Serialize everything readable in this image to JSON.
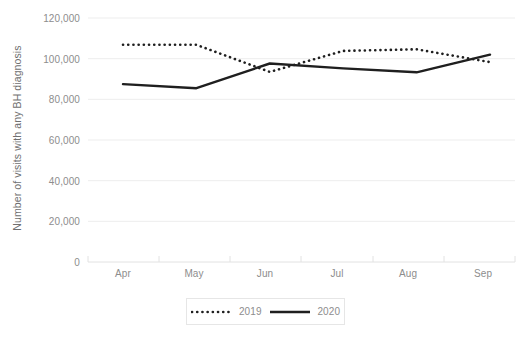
{
  "chart_data": {
    "type": "line",
    "title": "",
    "xlabel": "",
    "ylabel": "Number of visits with any BH diagnosis",
    "categories": [
      "Apr",
      "May",
      "Jun",
      "Jul",
      "Aug",
      "Sep"
    ],
    "ylim": [
      0,
      120000
    ],
    "y_ticks": [
      0,
      20000,
      40000,
      60000,
      80000,
      100000,
      120000
    ],
    "y_tick_labels": [
      "0",
      "20,000",
      "40,000",
      "60,000",
      "80,000",
      "100,000",
      "120,000"
    ],
    "grid": true,
    "legend_position": "bottom-center",
    "series": [
      {
        "name": "2019",
        "style": "dotted",
        "color": "#1f1f1f",
        "values": [
          106800,
          106800,
          93500,
          103800,
          104600,
          98300
        ]
      },
      {
        "name": "2020",
        "style": "solid",
        "color": "#1f1f1f",
        "values": [
          87500,
          85500,
          97600,
          95200,
          93300,
          102000
        ]
      }
    ],
    "annotations": []
  },
  "legend": {
    "entries": [
      {
        "label": "2019",
        "icon": "dotted-line-swatch"
      },
      {
        "label": "2020",
        "icon": "solid-line-swatch"
      }
    ]
  },
  "colors": {
    "series": "#1f1f1f",
    "grid": "#ededed",
    "tick_text": "#8d8d8d",
    "axis_title": "#6f6f6f",
    "background": "#ffffff",
    "legend_border": "#e6e6e6"
  }
}
